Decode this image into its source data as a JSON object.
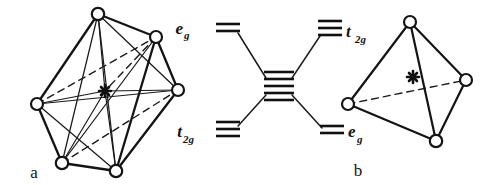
{
  "figure": {
    "caption_a": "a",
    "caption_b": "b",
    "background_color": "#ffffff",
    "ink_color": "#141414"
  },
  "panel_a": {
    "name": "octahedral-complex",
    "geometry": "octahedron",
    "vertex_count": 6,
    "center_marker": "asterisk",
    "center_marker_glyph": "*",
    "label": "a",
    "vertices": [
      {
        "id": "top",
        "x": 98,
        "y": 14
      },
      {
        "id": "upper-right",
        "x": 156,
        "y": 37
      },
      {
        "id": "right",
        "x": 178,
        "y": 90
      },
      {
        "id": "left",
        "x": 37,
        "y": 104
      },
      {
        "id": "lower-left",
        "x": 62,
        "y": 163
      },
      {
        "id": "lower-right",
        "x": 116,
        "y": 171
      }
    ],
    "center": {
      "x": 105,
      "y": 91
    },
    "solid_edges": [
      [
        "top",
        "upper-right"
      ],
      [
        "top",
        "left"
      ],
      [
        "top",
        "lower-left"
      ],
      [
        "top",
        "lower-right"
      ],
      [
        "top",
        "right"
      ],
      [
        "upper-right",
        "right"
      ],
      [
        "upper-right",
        "lower-right"
      ],
      [
        "upper-right",
        "lower-left"
      ],
      [
        "right",
        "lower-right"
      ],
      [
        "right",
        "left"
      ],
      [
        "left",
        "lower-left"
      ],
      [
        "left",
        "lower-right"
      ],
      [
        "lower-left",
        "lower-right"
      ],
      [
        "top",
        "center"
      ],
      [
        "left",
        "center"
      ],
      [
        "right",
        "center"
      ],
      [
        "lower-left",
        "center"
      ],
      [
        "lower-right",
        "center"
      ]
    ],
    "dashed_edges": [
      [
        "left",
        "upper-right"
      ],
      [
        "upper-right",
        "center"
      ],
      [
        "lower-left",
        "right"
      ]
    ]
  },
  "panel_b": {
    "name": "tetrahedral-complex",
    "geometry": "tetrahedron",
    "vertex_count": 4,
    "center_marker": "asterisk",
    "center_marker_glyph": "*",
    "label": "b",
    "vertices": [
      {
        "id": "top",
        "x": 410,
        "y": 22
      },
      {
        "id": "left",
        "x": 348,
        "y": 104
      },
      {
        "id": "right",
        "x": 466,
        "y": 80
      },
      {
        "id": "bottom",
        "x": 436,
        "y": 141
      }
    ],
    "center": {
      "x": 413,
      "y": 77
    },
    "solid_edges": [
      [
        "top",
        "left"
      ],
      [
        "top",
        "right"
      ],
      [
        "top",
        "bottom"
      ],
      [
        "left",
        "bottom"
      ],
      [
        "right",
        "bottom"
      ]
    ],
    "dashed_edges": [
      [
        "left",
        "right"
      ]
    ]
  },
  "splitting_diagram": {
    "name": "crystal-field-splitting-diagram",
    "free_ion": {
      "label": "",
      "level_count": 5,
      "degeneracy": 5,
      "x": 278,
      "y": 85
    },
    "octahedral_side": {
      "side": "left",
      "levels": [
        {
          "label": "e",
          "subscript": "g",
          "level_count": 2,
          "position": "upper",
          "label_x": 182,
          "label_y": 30,
          "line_x": 228,
          "line_y": 26
        },
        {
          "label": "t",
          "subscript": "2g",
          "level_count": 3,
          "position": "lower",
          "label_x": 178,
          "label_y": 135,
          "line_x": 228,
          "line_y": 130
        }
      ]
    },
    "tetrahedral_side": {
      "side": "right",
      "levels": [
        {
          "label": "t",
          "subscript": "2g",
          "level_count": 3,
          "position": "upper",
          "label_x": 345,
          "label_y": 35,
          "line_x": 312,
          "line_y": 28
        },
        {
          "label": "e",
          "subscript": "g",
          "level_count": 2,
          "position": "lower",
          "label_x": 348,
          "label_y": 135,
          "line_x": 313,
          "line_y": 130
        }
      ]
    },
    "correlation_lines": 4
  }
}
